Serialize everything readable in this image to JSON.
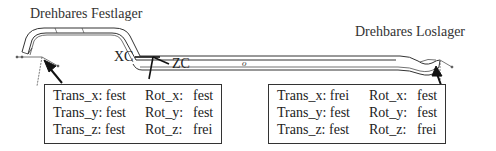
{
  "supports": {
    "left": {
      "title": "Drehbares Festlager",
      "rows": [
        {
          "trans_label": "Trans_x:",
          "trans_value": "fest",
          "rot_label": "Rot_x:",
          "rot_value": "fest"
        },
        {
          "trans_label": "Trans_y:",
          "trans_value": "fest",
          "rot_label": "Rot_y:",
          "rot_value": "fest"
        },
        {
          "trans_label": "Trans_z:",
          "trans_value": "fest",
          "rot_label": "Rot_z:",
          "rot_value": "frei"
        }
      ]
    },
    "right": {
      "title": "Drehbares Loslager",
      "rows": [
        {
          "trans_label": "Trans_x:",
          "trans_value": "frei",
          "rot_label": "Rot_x:",
          "rot_value": "fest"
        },
        {
          "trans_label": "Trans_y:",
          "trans_value": "fest",
          "rot_label": "Rot_y:",
          "rot_value": "fest"
        },
        {
          "trans_label": "Trans_z:",
          "trans_value": "fest",
          "rot_label": "Rot_z:",
          "rot_value": "frei"
        }
      ]
    }
  },
  "axes": {
    "xc": "XC",
    "zc": "ZC",
    "origin_mark": "o"
  },
  "colors": {
    "line": "#333333",
    "background": "#ffffff"
  }
}
